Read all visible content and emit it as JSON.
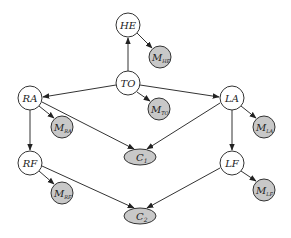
{
  "diagram": {
    "type": "bayesian-network",
    "hidden_nodes": [
      {
        "id": "HE",
        "label": "HE",
        "cx": 128,
        "cy": 25
      },
      {
        "id": "TO",
        "label": "TO",
        "cx": 128,
        "cy": 83
      },
      {
        "id": "RA",
        "label": "RA",
        "cx": 30,
        "cy": 98
      },
      {
        "id": "LA",
        "label": "LA",
        "cx": 232,
        "cy": 98
      },
      {
        "id": "RF",
        "label": "RF",
        "cx": 30,
        "cy": 163
      },
      {
        "id": "LF",
        "label": "LF",
        "cx": 232,
        "cy": 163
      }
    ],
    "measurement_nodes": [
      {
        "id": "M_HE",
        "main": "M",
        "sub": "HE",
        "cx": 160,
        "cy": 57
      },
      {
        "id": "M_TO",
        "main": "M",
        "sub": "TO",
        "cx": 159,
        "cy": 109
      },
      {
        "id": "M_RA",
        "main": "M",
        "sub": "RA",
        "cx": 62,
        "cy": 127
      },
      {
        "id": "M_LA",
        "main": "M",
        "sub": "LA",
        "cx": 264,
        "cy": 127
      },
      {
        "id": "M_RF",
        "main": "M",
        "sub": "RF",
        "cx": 62,
        "cy": 193
      },
      {
        "id": "M_LF",
        "main": "M",
        "sub": "LF",
        "cx": 264,
        "cy": 190
      }
    ],
    "constraint_nodes": [
      {
        "id": "C1",
        "main": "C",
        "sub": "1",
        "cx": 140,
        "cy": 157
      },
      {
        "id": "C2",
        "main": "C",
        "sub": "2",
        "cx": 140,
        "cy": 216
      }
    ],
    "edges": [
      [
        "TO",
        "HE"
      ],
      [
        "HE",
        "M_HE"
      ],
      [
        "TO",
        "M_TO"
      ],
      [
        "TO",
        "RA"
      ],
      [
        "TO",
        "LA"
      ],
      [
        "RA",
        "M_RA"
      ],
      [
        "LA",
        "M_LA"
      ],
      [
        "RA",
        "C1"
      ],
      [
        "LA",
        "C1"
      ],
      [
        "RA",
        "RF"
      ],
      [
        "LA",
        "LF"
      ],
      [
        "RF",
        "M_RF"
      ],
      [
        "LF",
        "M_LF"
      ],
      [
        "RF",
        "C2"
      ],
      [
        "LF",
        "C2"
      ]
    ],
    "colors": {
      "observed_fill": "#c8c8c8",
      "hidden_fill": "#ffffff",
      "stroke": "#333333"
    }
  }
}
